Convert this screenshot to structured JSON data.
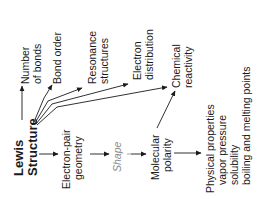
{
  "root": {
    "line1": "Lewis",
    "line2": "Structure"
  },
  "top_branch": [
    {
      "id": "number-of-bonds",
      "lines": [
        "Number",
        "of bonds"
      ]
    },
    {
      "id": "bond-order",
      "lines": [
        "Bond order"
      ]
    },
    {
      "id": "resonance-structures",
      "lines": [
        "Resonance",
        "structures"
      ]
    },
    {
      "id": "electron-distribution",
      "lines": [
        "Electron",
        "distribution"
      ]
    },
    {
      "id": "chemical-reactivity",
      "lines": [
        "Chemical",
        "reactivity"
      ]
    }
  ],
  "main_chain": [
    {
      "id": "electron-pair-geometry",
      "lines": [
        "Electron-pair",
        "geometry"
      ]
    },
    {
      "id": "shape",
      "lines": [
        "Shape"
      ]
    },
    {
      "id": "molecular-polarity",
      "lines": [
        "Molecular",
        "polarity"
      ]
    }
  ],
  "physical_properties": {
    "title": "Physical properties",
    "items": [
      "vapor pressure",
      "solubility",
      "boiling and melting points"
    ]
  },
  "colors": {
    "text": "#1a1a1a",
    "shape_label": "#8a8a8a",
    "background": "#ffffff"
  }
}
